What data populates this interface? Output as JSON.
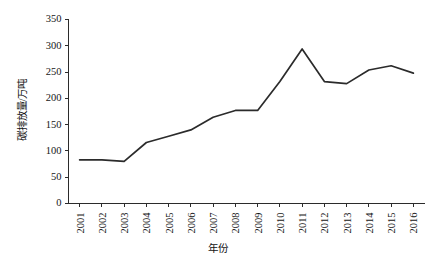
{
  "chart_data": {
    "type": "line",
    "title": "",
    "xlabel": "年份",
    "ylabel": "碳排放量/万吨",
    "categories": [
      "2001",
      "2002",
      "2003",
      "2004",
      "2005",
      "2006",
      "2007",
      "2008",
      "2009",
      "2010",
      "2011",
      "2012",
      "2013",
      "2014",
      "2015",
      "2016"
    ],
    "values": [
      83,
      83,
      80,
      116,
      128,
      140,
      164,
      177,
      177,
      232,
      294,
      232,
      228,
      254,
      262,
      248
    ],
    "series": [
      {
        "name": "碳排放量",
        "values": [
          83,
          83,
          80,
          116,
          128,
          140,
          164,
          177,
          177,
          232,
          294,
          232,
          228,
          254,
          262,
          248
        ]
      }
    ],
    "ylim": [
      0,
      350
    ],
    "yticks": [
      0,
      50,
      100,
      150,
      200,
      250,
      300,
      350
    ],
    "ytick_labels": [
      "0",
      "50",
      "100",
      "150",
      "200",
      "250",
      "300",
      "350"
    ],
    "xtick_labels": [
      "2001",
      "2002",
      "2003",
      "2004",
      "2005",
      "2006",
      "2007",
      "2008",
      "2009",
      "2010",
      "2011",
      "2012",
      "2013",
      "2014",
      "2015",
      "2016"
    ],
    "grid": false,
    "legend": null,
    "legend_position": "none",
    "line_color": "#2b2b2b",
    "axis_color": "#2b2b2b",
    "background_color": "#ffffff",
    "annotations": []
  }
}
